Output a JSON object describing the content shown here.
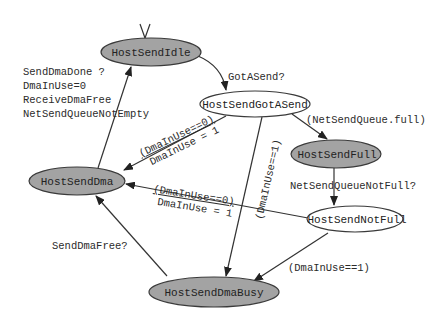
{
  "diagram": {
    "type": "state-machine",
    "colors": {
      "shaded_fill": "#a3a3a3",
      "plain_fill": "#ffffff",
      "stroke": "#3a3a3a"
    },
    "nodes": {
      "idle": {
        "label": "HostSendIdle",
        "style": "shaded"
      },
      "got_a_send": {
        "label": "HostSendGotASend",
        "style": "plain"
      },
      "full": {
        "label": "HostSendFull",
        "style": "shaded"
      },
      "dma": {
        "label": "HostSendDma",
        "style": "shaded"
      },
      "not_full": {
        "label": "HostSendNotFull",
        "style": "plain"
      },
      "dma_busy": {
        "label": "HostSendDmaBusy",
        "style": "shaded"
      }
    },
    "edges": {
      "idle_to_got": {
        "from": "HostSendIdle",
        "to": "HostSendGotASend",
        "label": "GotASend?"
      },
      "got_to_full": {
        "from": "HostSendGotASend",
        "to": "HostSendFull",
        "label": "(NetSendQueue.full)"
      },
      "got_to_dma": {
        "from": "HostSendGotASend",
        "to": "HostSendDma",
        "label_line1": "(DmaInUse==0)",
        "label_line2": "DmaInUse = 1"
      },
      "got_to_busy": {
        "from": "HostSendGotASend",
        "to": "HostSendDmaBusy",
        "label": "(DmaInUse==1)"
      },
      "full_to_notfull": {
        "from": "HostSendFull",
        "to": "HostSendNotFull",
        "label": "NetSendQueueNotFull?"
      },
      "notfull_to_dma": {
        "from": "HostSendNotFull",
        "to": "HostSendDma",
        "label_line1": "(DmaInUse==0)",
        "label_line2": "DmaInUse = 1"
      },
      "notfull_to_busy": {
        "from": "HostSendNotFull",
        "to": "HostSendDmaBusy",
        "label": "(DmaInUse==1)"
      },
      "busy_to_dma": {
        "from": "HostSendDmaBusy",
        "to": "HostSendDma",
        "label": "SendDmaFree?"
      },
      "dma_to_idle": {
        "from": "HostSendDma",
        "to": "HostSendIdle",
        "label_lines": [
          "SendDmaDone ?",
          "DmaInUse=0",
          "ReceiveDmaFree",
          "NetSendQueueNotEmpty"
        ]
      }
    }
  }
}
